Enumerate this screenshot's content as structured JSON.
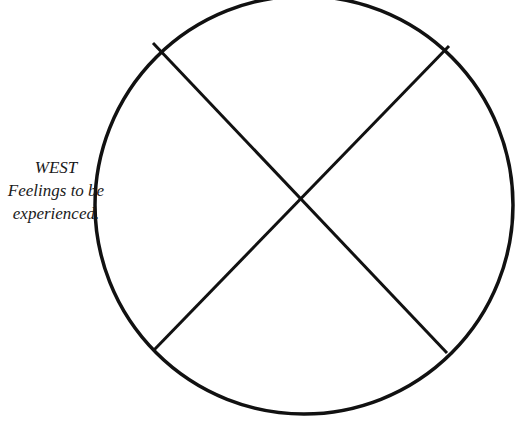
{
  "diagram": {
    "type": "medicine-wheel",
    "stroke_color": "#111111",
    "background_color": "#ffffff",
    "circle": {
      "cx": 304,
      "cy": 205,
      "rx": 209,
      "ry": 209,
      "stroke_width": 3.5
    },
    "cross_lines": [
      {
        "name": "diagonal-nw-se",
        "x1": 153,
        "y1": 43,
        "x2": 447,
        "y2": 353
      },
      {
        "name": "diagonal-ne-sw",
        "x1": 449,
        "y1": 46,
        "x2": 154,
        "y2": 350
      }
    ],
    "labels": {
      "west": {
        "direction": "WEST",
        "line1": "Feelings to be",
        "line2": "experienced."
      }
    }
  }
}
